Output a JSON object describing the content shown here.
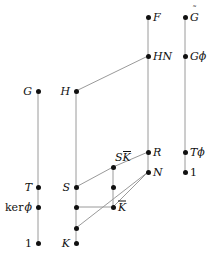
{
  "diagram": {
    "kind": "subgroup-lattice-hasse-diagram",
    "canvas": {
      "width": 223,
      "height": 256
    },
    "style": {
      "edge_color": "#9a9a9a",
      "node_color": "#111111",
      "background": "#ffffff"
    },
    "nodes": [
      {
        "id": "G",
        "label": "G",
        "label_kind": "plain",
        "x": 38,
        "y": 91,
        "label_pos": "left"
      },
      {
        "id": "T",
        "label": "T",
        "label_kind": "plain",
        "x": 38,
        "y": 187,
        "label_pos": "left"
      },
      {
        "id": "kerphi",
        "label": "ker ϕ",
        "label_kind": "kerphi",
        "x": 38,
        "y": 207,
        "label_pos": "left"
      },
      {
        "id": "one_L",
        "label": "1",
        "label_kind": "upright",
        "x": 38,
        "y": 243,
        "label_pos": "left"
      },
      {
        "id": "H",
        "label": "H",
        "label_kind": "plain",
        "x": 76,
        "y": 91,
        "label_pos": "left"
      },
      {
        "id": "S",
        "label": "S",
        "label_kind": "plain",
        "x": 76,
        "y": 187,
        "label_pos": "left"
      },
      {
        "id": "m1",
        "label": "",
        "label_kind": "none",
        "x": 76,
        "y": 207,
        "label_pos": "none"
      },
      {
        "id": "m2",
        "label": "",
        "label_kind": "none",
        "x": 76,
        "y": 228,
        "label_pos": "none"
      },
      {
        "id": "K",
        "label": "K",
        "label_kind": "plain",
        "x": 76,
        "y": 243,
        "label_pos": "left"
      },
      {
        "id": "SKbar",
        "label": "SK̄",
        "label_kind": "s-kbar",
        "x": 113,
        "y": 167,
        "label_pos": "above"
      },
      {
        "id": "c1",
        "label": "",
        "label_kind": "none",
        "x": 113,
        "y": 187,
        "label_pos": "none"
      },
      {
        "id": "Kbar",
        "label": "K̄",
        "label_kind": "kbar",
        "x": 113,
        "y": 207,
        "label_pos": "right"
      },
      {
        "id": "F",
        "label": "F",
        "label_kind": "plain",
        "x": 148,
        "y": 17,
        "label_pos": "right"
      },
      {
        "id": "HN",
        "label": "HN",
        "label_kind": "plain",
        "x": 148,
        "y": 56,
        "label_pos": "right"
      },
      {
        "id": "R",
        "label": "R",
        "label_kind": "plain",
        "x": 148,
        "y": 152,
        "label_pos": "right"
      },
      {
        "id": "N",
        "label": "N",
        "label_kind": "plain",
        "x": 148,
        "y": 172,
        "label_pos": "right"
      },
      {
        "id": "Gtil",
        "label": "G̃",
        "label_kind": "gtilde",
        "x": 185,
        "y": 17,
        "label_pos": "right"
      },
      {
        "id": "Gphi",
        "label": "Gϕ",
        "label_kind": "gphi",
        "x": 185,
        "y": 56,
        "label_pos": "right"
      },
      {
        "id": "Tphi",
        "label": "Tϕ",
        "label_kind": "tphi",
        "x": 185,
        "y": 152,
        "label_pos": "right"
      },
      {
        "id": "one_R",
        "label": "1",
        "label_kind": "upright",
        "x": 185,
        "y": 172,
        "label_pos": "right"
      }
    ],
    "edges": [
      {
        "from": "G",
        "to": "T"
      },
      {
        "from": "T",
        "to": "kerphi"
      },
      {
        "from": "kerphi",
        "to": "one_L"
      },
      {
        "from": "H",
        "to": "S"
      },
      {
        "from": "S",
        "to": "m1"
      },
      {
        "from": "m1",
        "to": "m2"
      },
      {
        "from": "m2",
        "to": "K"
      },
      {
        "from": "SKbar",
        "to": "c1"
      },
      {
        "from": "c1",
        "to": "Kbar"
      },
      {
        "from": "F",
        "to": "HN"
      },
      {
        "from": "HN",
        "to": "R"
      },
      {
        "from": "R",
        "to": "N"
      },
      {
        "from": "Gtil",
        "to": "Gphi"
      },
      {
        "from": "Gphi",
        "to": "Tphi"
      },
      {
        "from": "Tphi",
        "to": "one_R"
      },
      {
        "from": "H",
        "to": "HN"
      },
      {
        "from": "S",
        "to": "SKbar"
      },
      {
        "from": "SKbar",
        "to": "R"
      },
      {
        "from": "m1",
        "to": "Kbar"
      },
      {
        "from": "Kbar",
        "to": "N"
      },
      {
        "from": "m2",
        "to": "N"
      }
    ]
  }
}
